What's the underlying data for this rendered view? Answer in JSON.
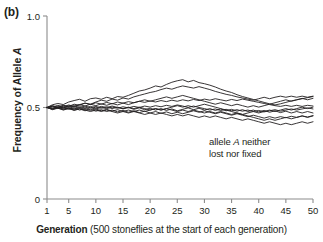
{
  "panel": {
    "label": "(b)"
  },
  "axes": {
    "y": {
      "title_prefix": "Frequency of Allele ",
      "title_italic": "A",
      "ticks": [
        "0",
        "0.5",
        "1.0"
      ],
      "tick_values": [
        0,
        0.5,
        1.0
      ],
      "min": 0,
      "max": 1.0
    },
    "x": {
      "caption_bold": "Generation",
      "caption_rest": " (500 stoneflies at the start of each generation)",
      "ticks": [
        "1",
        "5",
        "10",
        "15",
        "20",
        "25",
        "30",
        "35",
        "40",
        "45",
        "50"
      ],
      "tick_values": [
        1,
        5,
        10,
        15,
        20,
        25,
        30,
        35,
        40,
        45,
        50
      ],
      "min": 1,
      "max": 50
    }
  },
  "annotation": {
    "line1_prefix": "allele ",
    "line1_italic": "A",
    "line1_suffix": " neither",
    "line2": "lost nor fixed"
  },
  "style": {
    "line_color": "#231f20",
    "axis_color": "#8c8c8c",
    "text_color": "#231f20",
    "background": "#ffffff"
  },
  "chart_data": {
    "type": "line",
    "title": "",
    "xlabel": "Generation (500 stoneflies at the start of each generation)",
    "ylabel": "Frequency of Allele A",
    "xlim": [
      1,
      50
    ],
    "ylim": [
      0,
      1.0
    ],
    "grid": false,
    "legend": null,
    "annotations": [
      {
        "text": "allele A neither lost nor fixed",
        "x": 33,
        "y": 0.3
      }
    ],
    "x": [
      1,
      2,
      3,
      4,
      5,
      6,
      7,
      8,
      9,
      10,
      11,
      12,
      13,
      14,
      15,
      16,
      17,
      18,
      19,
      20,
      21,
      22,
      23,
      24,
      25,
      26,
      27,
      28,
      29,
      30,
      31,
      32,
      33,
      34,
      35,
      36,
      37,
      38,
      39,
      40,
      41,
      42,
      43,
      44,
      45,
      46,
      47,
      48,
      49,
      50
    ],
    "series": [
      {
        "name": "population 1",
        "values": [
          0.5,
          0.515,
          0.522,
          0.516,
          0.53,
          0.538,
          0.545,
          0.534,
          0.548,
          0.552,
          0.545,
          0.556,
          0.548,
          0.56,
          0.556,
          0.566,
          0.578,
          0.59,
          0.596,
          0.606,
          0.618,
          0.612,
          0.626,
          0.638,
          0.646,
          0.652,
          0.64,
          0.648,
          0.636,
          0.63,
          0.622,
          0.612,
          0.6,
          0.59,
          0.582,
          0.57,
          0.56,
          0.552,
          0.544,
          0.536,
          0.528,
          0.52,
          0.514,
          0.52,
          0.528,
          0.536,
          0.542,
          0.548,
          0.554,
          0.56
        ]
      },
      {
        "name": "population 2",
        "values": [
          0.5,
          0.508,
          0.5,
          0.512,
          0.506,
          0.518,
          0.512,
          0.524,
          0.518,
          0.53,
          0.54,
          0.534,
          0.546,
          0.54,
          0.552,
          0.546,
          0.558,
          0.566,
          0.574,
          0.582,
          0.588,
          0.598,
          0.606,
          0.6,
          0.61,
          0.618,
          0.612,
          0.606,
          0.614,
          0.606,
          0.598,
          0.588,
          0.58,
          0.572,
          0.566,
          0.558,
          0.552,
          0.546,
          0.54,
          0.548,
          0.556,
          0.548,
          0.556,
          0.562,
          0.556,
          0.562,
          0.556,
          0.562,
          0.556,
          0.562
        ]
      },
      {
        "name": "population 3",
        "values": [
          0.5,
          0.496,
          0.504,
          0.498,
          0.51,
          0.504,
          0.516,
          0.524,
          0.516,
          0.526,
          0.518,
          0.528,
          0.52,
          0.53,
          0.524,
          0.532,
          0.526,
          0.534,
          0.528,
          0.536,
          0.53,
          0.538,
          0.532,
          0.54,
          0.534,
          0.542,
          0.536,
          0.544,
          0.538,
          0.546,
          0.54,
          0.548,
          0.542,
          0.536,
          0.544,
          0.538,
          0.546,
          0.54,
          0.534,
          0.528,
          0.522,
          0.516,
          0.51,
          0.506,
          0.512,
          0.506,
          0.512,
          0.506,
          0.512,
          0.508
        ]
      },
      {
        "name": "population 4",
        "values": [
          0.5,
          0.492,
          0.5,
          0.492,
          0.498,
          0.49,
          0.498,
          0.49,
          0.498,
          0.492,
          0.5,
          0.494,
          0.502,
          0.496,
          0.504,
          0.498,
          0.506,
          0.5,
          0.508,
          0.502,
          0.51,
          0.504,
          0.512,
          0.506,
          0.514,
          0.508,
          0.5,
          0.508,
          0.5,
          0.494,
          0.486,
          0.492,
          0.484,
          0.49,
          0.482,
          0.488,
          0.48,
          0.486,
          0.478,
          0.484,
          0.476,
          0.482,
          0.488,
          0.48,
          0.486,
          0.492,
          0.486,
          0.492,
          0.498,
          0.492
        ]
      },
      {
        "name": "population 5",
        "values": [
          0.5,
          0.488,
          0.496,
          0.486,
          0.494,
          0.484,
          0.492,
          0.482,
          0.49,
          0.48,
          0.488,
          0.478,
          0.486,
          0.476,
          0.484,
          0.474,
          0.482,
          0.472,
          0.48,
          0.47,
          0.478,
          0.468,
          0.476,
          0.466,
          0.474,
          0.466,
          0.474,
          0.482,
          0.474,
          0.482,
          0.474,
          0.466,
          0.474,
          0.466,
          0.458,
          0.466,
          0.458,
          0.45,
          0.458,
          0.45,
          0.442,
          0.45,
          0.442,
          0.45,
          0.444,
          0.452,
          0.446,
          0.454,
          0.448,
          0.456
        ]
      },
      {
        "name": "population 6",
        "values": [
          0.5,
          0.506,
          0.494,
          0.502,
          0.49,
          0.498,
          0.486,
          0.494,
          0.484,
          0.492,
          0.482,
          0.49,
          0.48,
          0.488,
          0.478,
          0.47,
          0.478,
          0.47,
          0.462,
          0.47,
          0.462,
          0.47,
          0.462,
          0.454,
          0.462,
          0.454,
          0.462,
          0.454,
          0.446,
          0.454,
          0.446,
          0.454,
          0.446,
          0.438,
          0.446,
          0.438,
          0.43,
          0.438,
          0.43,
          0.422,
          0.414,
          0.422,
          0.414,
          0.406,
          0.414,
          0.406,
          0.414,
          0.422,
          0.414,
          0.422
        ]
      },
      {
        "name": "population 7",
        "values": [
          0.5,
          0.51,
          0.502,
          0.51,
          0.502,
          0.51,
          0.5,
          0.508,
          0.498,
          0.506,
          0.496,
          0.504,
          0.494,
          0.502,
          0.492,
          0.5,
          0.49,
          0.498,
          0.488,
          0.496,
          0.486,
          0.494,
          0.484,
          0.492,
          0.482,
          0.49,
          0.498,
          0.488,
          0.496,
          0.486,
          0.494,
          0.484,
          0.492,
          0.482,
          0.49,
          0.48,
          0.488,
          0.478,
          0.486,
          0.476,
          0.484,
          0.474,
          0.482,
          0.472,
          0.48,
          0.47,
          0.478,
          0.47,
          0.478,
          0.47
        ]
      },
      {
        "name": "population 8",
        "values": [
          0.5,
          0.494,
          0.502,
          0.496,
          0.504,
          0.496,
          0.504,
          0.498,
          0.506,
          0.498,
          0.506,
          0.5,
          0.508,
          0.5,
          0.494,
          0.502,
          0.494,
          0.502,
          0.494,
          0.486,
          0.494,
          0.486,
          0.494,
          0.486,
          0.478,
          0.486,
          0.478,
          0.486,
          0.478,
          0.47,
          0.478,
          0.47,
          0.478,
          0.47,
          0.462,
          0.47,
          0.462,
          0.47,
          0.478,
          0.47,
          0.478,
          0.486,
          0.478,
          0.486,
          0.494,
          0.486,
          0.494,
          0.502,
          0.494,
          0.502
        ]
      },
      {
        "name": "population 9",
        "values": [
          0.5,
          0.502,
          0.512,
          0.504,
          0.514,
          0.506,
          0.516,
          0.508,
          0.518,
          0.51,
          0.52,
          0.512,
          0.522,
          0.514,
          0.524,
          0.516,
          0.526,
          0.534,
          0.542,
          0.534,
          0.542,
          0.55,
          0.558,
          0.55,
          0.558,
          0.566,
          0.558,
          0.55,
          0.542,
          0.534,
          0.526,
          0.518,
          0.526,
          0.518,
          0.51,
          0.518,
          0.51,
          0.502,
          0.51,
          0.502,
          0.51,
          0.518,
          0.526,
          0.534,
          0.542,
          0.534,
          0.542,
          0.55,
          0.542,
          0.55
        ]
      },
      {
        "name": "population 10",
        "values": [
          0.5,
          0.49,
          0.498,
          0.488,
          0.496,
          0.486,
          0.494,
          0.486,
          0.478,
          0.486,
          0.478,
          0.486,
          0.478,
          0.47,
          0.478,
          0.486,
          0.478,
          0.486,
          0.478,
          0.486,
          0.494,
          0.486,
          0.494,
          0.502,
          0.51,
          0.502,
          0.51,
          0.502,
          0.51,
          0.518,
          0.51,
          0.502,
          0.494,
          0.486,
          0.478,
          0.47,
          0.462,
          0.454,
          0.446,
          0.438,
          0.43,
          0.438,
          0.43,
          0.438,
          0.446,
          0.438,
          0.446,
          0.454,
          0.446,
          0.454
        ]
      }
    ]
  }
}
